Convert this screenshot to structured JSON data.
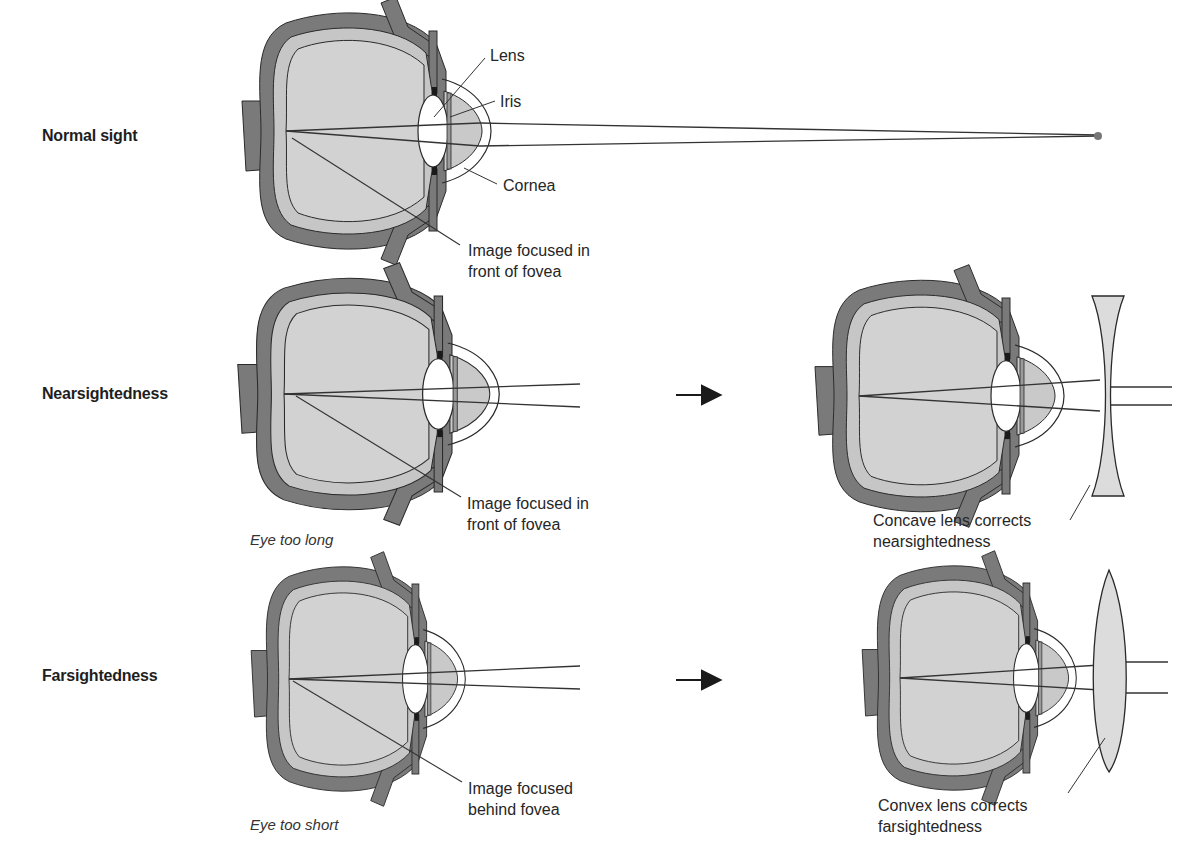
{
  "figure": {
    "rows": [
      {
        "id": "normal",
        "label": "Normal sight",
        "callouts": {
          "lens": "Lens",
          "iris": "Iris",
          "cornea": "Cornea",
          "focus_line1": "Image focused in",
          "focus_line2": "front of fovea"
        }
      },
      {
        "id": "nearsightedness",
        "label": "Nearsightedness",
        "caption": "Eye too long",
        "callouts": {
          "focus_line1": "Image focused in",
          "focus_line2": "front of fovea"
        },
        "correction": {
          "lens_type": "concave",
          "line1": "Concave lens corrects",
          "line2": "nearsightedness"
        }
      },
      {
        "id": "farsightedness",
        "label": "Farsightedness",
        "caption": "Eye too short",
        "callouts": {
          "focus_line1": "Image focused",
          "focus_line2": "behind fovea"
        },
        "correction": {
          "lens_type": "convex",
          "line1": "Convex lens corrects",
          "line2": "farsightedness"
        }
      }
    ],
    "arrow_glyph": "right-arrow",
    "colors": {
      "sclera": "#7a7a7a",
      "vitreous": "#d2d2d2",
      "lens": "#ffffff",
      "iris": "#1a1a1a",
      "stroke": "#2a2a2a",
      "corrective_lens": "#dcdcdc",
      "background": "#ffffff"
    }
  }
}
